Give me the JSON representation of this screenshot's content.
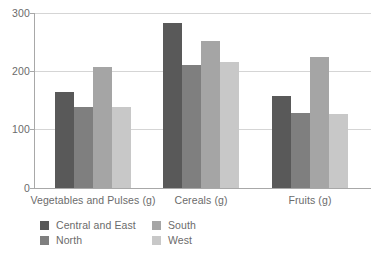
{
  "chart_data": {
    "type": "bar",
    "title": "",
    "subtitle": "",
    "xlabel": "",
    "ylabel": "",
    "categories": [
      "Vegetables and Pulses (g)",
      "Cereals (g)",
      "Fruits (g)"
    ],
    "series": [
      {
        "name": "Central and East",
        "color": "#595959",
        "values": [
          165,
          282,
          157
        ]
      },
      {
        "name": "North",
        "color": "#7f7f7f",
        "values": [
          138,
          211,
          129
        ]
      },
      {
        "name": "South",
        "color": "#a5a5a5",
        "values": [
          208,
          252,
          224
        ]
      },
      {
        "name": "West",
        "color": "#c8c8c8",
        "values": [
          138,
          216,
          127
        ]
      }
    ],
    "ylim": [
      0,
      300
    ],
    "yticks": [
      0,
      100,
      200,
      300
    ],
    "ytick_labels": [
      "0",
      "100",
      "200",
      "300"
    ],
    "grid": true,
    "grid_color": "#d5d5d5",
    "axis_color": "#a8a8a8",
    "legend_position": "bottom-left",
    "legend_columns": 2,
    "background": "#ffffff",
    "text_color": "#6b6b6b"
  }
}
